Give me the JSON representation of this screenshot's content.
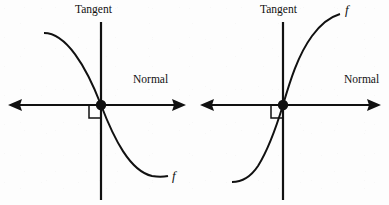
{
  "figure": {
    "background_color": "#fdfdfd",
    "ink_color": "#111111",
    "panels": [
      {
        "id": "left-panel",
        "name": "decreasing-curve-panel",
        "tangent_label": "Tangent",
        "normal_label": "Normal",
        "function_label": "f",
        "curve_direction": "decreasing",
        "origin": {
          "x": 101,
          "y": 105
        },
        "normal_axis": {
          "x1": 8,
          "y1": 105,
          "x2": 186,
          "y2": 105
        },
        "tangent_axis": {
          "x1": 101,
          "y1": 22,
          "x2": 101,
          "y2": 200
        },
        "right_angle_square": {
          "x": 89,
          "y": 105,
          "w": 12,
          "h": 13
        },
        "curve_start": {
          "x": 44,
          "y": 33
        },
        "curve_end": {
          "x": 168,
          "y": 177
        },
        "tangent_label_pos": {
          "x": 75,
          "y": 4
        },
        "normal_label_pos": {
          "x": 133,
          "y": 74
        },
        "function_label_pos": {
          "x": 172,
          "y": 169
        }
      },
      {
        "id": "right-panel",
        "name": "increasing-curve-panel",
        "tangent_label": "Tangent",
        "normal_label": "Normal",
        "function_label": "f",
        "curve_direction": "increasing",
        "origin": {
          "x": 283,
          "y": 105
        },
        "normal_axis": {
          "x1": 200,
          "y1": 105,
          "x2": 381,
          "y2": 105
        },
        "tangent_axis": {
          "x1": 283,
          "y1": 22,
          "x2": 283,
          "y2": 200
        },
        "right_angle_square": {
          "x": 271,
          "y": 105,
          "w": 12,
          "h": 13
        },
        "curve_start": {
          "x": 232,
          "y": 182
        },
        "curve_end": {
          "x": 340,
          "y": 14
        },
        "tangent_label_pos": {
          "x": 260,
          "y": 4
        },
        "normal_label_pos": {
          "x": 344,
          "y": 74
        },
        "function_label_pos": {
          "x": 344,
          "y": 3
        }
      }
    ]
  }
}
